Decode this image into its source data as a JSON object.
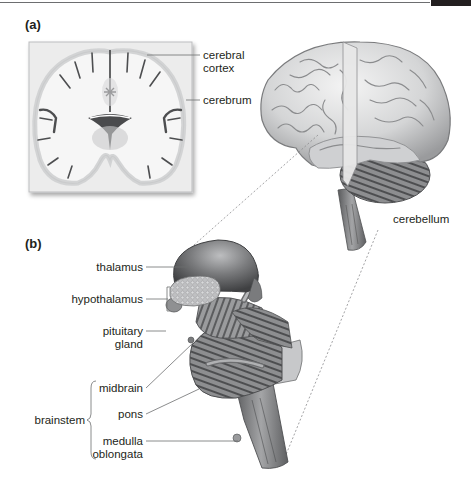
{
  "figure": {
    "panels": [
      {
        "id": "a",
        "label": "(a)",
        "labels": {
          "cerebral_cortex_line1": "cerebral",
          "cerebral_cortex_line2": "cortex",
          "cerebrum": "cerebrum",
          "cerebellum": "cerebellum"
        }
      },
      {
        "id": "b",
        "label": "(b)",
        "labels": {
          "thalamus": "thalamus",
          "hypothalamus": "hypothalamus",
          "pituitary_line1": "pituitary",
          "pituitary_line2": "gland",
          "midbrain": "midbrain",
          "pons": "pons",
          "medulla_line1": "medulla",
          "medulla_line2": "oblongata",
          "brainstem": "brainstem"
        }
      }
    ],
    "colors": {
      "text": "#231f20",
      "leader_line": "#6d6e70",
      "tissue_light": "#e6e6e6",
      "tissue_mid": "#a7a9ac",
      "tissue_dark": "#58595b"
    }
  }
}
